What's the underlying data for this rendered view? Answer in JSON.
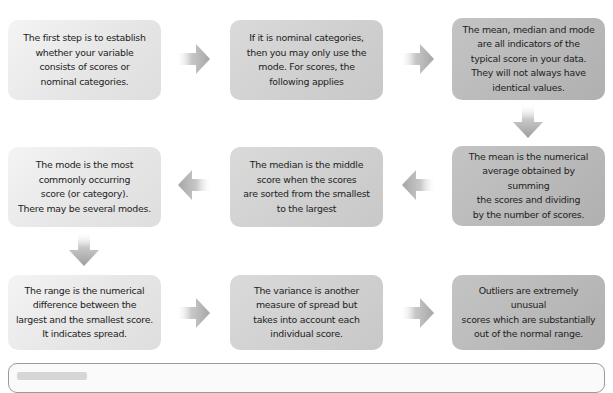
{
  "diagram": {
    "type": "flowchart",
    "boxes": [
      {
        "id": "step-1",
        "text": "The first step is to establish\nwhether your variable\nconsists of scores or\nnominal categories.",
        "shade": "light"
      },
      {
        "id": "step-2",
        "text": "If it is nominal categories,\nthen you may only use the\nmode. For scores, the\nfollowing applies",
        "shade": "medium"
      },
      {
        "id": "step-3",
        "text": "The mean, median and mode\nare all indicators of the\ntypical score in your data.\nThey will not always have\nidentical values.",
        "shade": "dark"
      },
      {
        "id": "step-4",
        "text": "The mean is the numerical\naverage obtained by summing\nthe scores and dividing\nby the number of scores.",
        "shade": "dark"
      },
      {
        "id": "step-5",
        "text": "The median is the middle\nscore when the scores\nare sorted from the smallest\nto the largest",
        "shade": "medium"
      },
      {
        "id": "step-6",
        "text": "The mode is the most\ncommonly occurring\nscore (or category).\nThere may be several modes.",
        "shade": "light"
      },
      {
        "id": "step-7",
        "text": "The range is the  numerical\ndifference between the\nlargest and the smallest score.\nIt indicates spread.",
        "shade": "light"
      },
      {
        "id": "step-8",
        "text": "The variance is another\nmeasure of spread but\ntakes into account each\nindividual score.",
        "shade": "medium"
      },
      {
        "id": "step-9",
        "text": "Outliers are extremely unusual\nscores which are substantially\nout of the normal range.",
        "shade": "dark"
      }
    ],
    "arrows": [
      {
        "from": "step-1",
        "to": "step-2",
        "direction": "right"
      },
      {
        "from": "step-2",
        "to": "step-3",
        "direction": "right"
      },
      {
        "from": "step-3",
        "to": "step-4",
        "direction": "down"
      },
      {
        "from": "step-4",
        "to": "step-5",
        "direction": "left"
      },
      {
        "from": "step-5",
        "to": "step-6",
        "direction": "left"
      },
      {
        "from": "step-6",
        "to": "step-7",
        "direction": "down"
      },
      {
        "from": "step-7",
        "to": "step-8",
        "direction": "right"
      },
      {
        "from": "step-8",
        "to": "step-9",
        "direction": "right"
      }
    ]
  },
  "colors": {
    "light_box": "#e8e8e8",
    "medium_box": "#d0d0d0",
    "dark_box": "#b9b9b9",
    "arrow": "#a8a8a8",
    "text": "#222222",
    "panel_border": "#9a9a9a"
  }
}
